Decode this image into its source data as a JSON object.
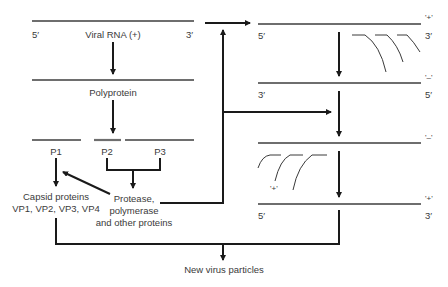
{
  "diagram": {
    "left_column": {
      "viral_rna": {
        "label": "Viral RNA (+)",
        "end5": "5′",
        "end3": "3′"
      },
      "polyprotein": {
        "label": "Polyprotein"
      },
      "cleavage_products": [
        "P1",
        "P2",
        "P3"
      ],
      "capsid": {
        "line1": "Capsid proteins",
        "line2": "VP1, VP2, VP3, VP4"
      },
      "nonstructural": {
        "line1": "Protease,",
        "line2": "polymerase",
        "line3": "and other proteins"
      }
    },
    "right_column": {
      "strands": [
        {
          "sense": "'+'",
          "left_end": "5′",
          "right_end": "3′"
        },
        {
          "sense": "'–'",
          "left_end": "3′",
          "right_end": "5′"
        },
        {
          "sense": "'–'",
          "left_end": "",
          "right_end": ""
        },
        {
          "sense": "'+'",
          "left_end": "5′",
          "right_end": "3′"
        }
      ],
      "nascent_label": "'+'"
    },
    "output": {
      "label": "New virus particles"
    },
    "colors": {
      "strand": "#6e6e6e",
      "arrow": "#1a1a1a",
      "text": "#3a3a3a",
      "background": "#ffffff"
    }
  }
}
